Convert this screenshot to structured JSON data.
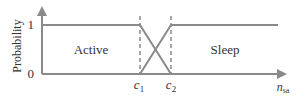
{
  "chart_data": {
    "type": "line",
    "title": "",
    "xlabel": "n_sa",
    "xlabel_main": "n",
    "xlabel_sub": "sa",
    "ylabel": "Probability",
    "yticks": [
      "0",
      "1"
    ],
    "xticks": [
      {
        "main": "c",
        "sub": "1"
      },
      {
        "main": "c",
        "sub": "2"
      }
    ],
    "regions": [
      {
        "label": "Active"
      },
      {
        "label": "Sleep"
      }
    ],
    "series": [
      {
        "name": "Active",
        "points": [
          [
            "0",
            1
          ],
          [
            "c1",
            1
          ],
          [
            "c2",
            0
          ],
          [
            "end",
            0
          ]
        ]
      },
      {
        "name": "Sleep",
        "points": [
          [
            "0",
            0
          ],
          [
            "c1",
            0
          ],
          [
            "c2",
            1
          ],
          [
            "end",
            1
          ]
        ]
      }
    ],
    "ylim": [
      0,
      1
    ],
    "grid": false,
    "dashed_markers": [
      "c1",
      "c2"
    ]
  },
  "colors": {
    "line": "#8a8a8a",
    "axis": "#8a8a8a",
    "text": "#333333"
  }
}
